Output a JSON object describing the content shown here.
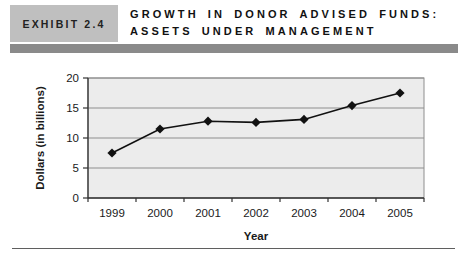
{
  "header": {
    "exhibit_label": "EXHIBIT 2.4",
    "title_line1": "GROWTH IN DONOR ADVISED FUNDS:",
    "title_line2": "ASSETS UNDER MANAGEMENT"
  },
  "colors": {
    "exhibit_box_bg": "#bfbfbf",
    "header_bar": "#8a8a8a",
    "plot_bg": "#ececec",
    "plot_border": "#8e8e8e",
    "gridline": "#8e8e8e",
    "axis": "#333333",
    "series": "#111111",
    "text": "#1a1a1a"
  },
  "chart_data": {
    "type": "line",
    "categories": [
      "1999",
      "2000",
      "2001",
      "2002",
      "2003",
      "2004",
      "2005"
    ],
    "values": [
      7.5,
      11.5,
      12.8,
      12.6,
      13.1,
      15.4,
      17.5
    ],
    "title": "",
    "xlabel": "Year",
    "ylabel": "Dollars (in billions)",
    "ylim": [
      0,
      20
    ],
    "yticks": [
      0,
      5,
      10,
      15,
      20
    ],
    "marker": "diamond",
    "grid": "horizontal",
    "legend": "none"
  }
}
